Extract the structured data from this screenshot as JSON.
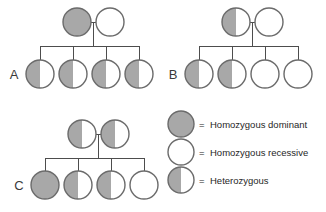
{
  "figure": {
    "type": "pedigree-genotype-chart",
    "colors": {
      "dominant_fill": "#a8a8a8",
      "recessive_fill": "#ffffff",
      "outline": "#6b6b6b",
      "line": "#4d4d4d",
      "text": "#262626",
      "label": "#3a3a3a",
      "background": "#ffffff"
    }
  },
  "panels": [
    {
      "id": "A",
      "label": "A",
      "label_x": 14,
      "label_y": 79,
      "parents": [
        {
          "name": "parent-1",
          "genotype": "homozygous-dominant",
          "cx": 77,
          "cy": 22,
          "r": 14
        },
        {
          "name": "parent-2",
          "genotype": "homozygous-recessive",
          "cx": 110,
          "cy": 22,
          "r": 14
        }
      ],
      "marriage_line": {
        "x1": 91,
        "y1": 22,
        "x2": 96,
        "y2": 22
      },
      "descent_line": {
        "x": 93.5,
        "y1": 22,
        "y2": 46
      },
      "sibship_line": {
        "x1": 40,
        "y1": 46,
        "x2": 140,
        "y2": 46
      },
      "children": [
        {
          "name": "child-1",
          "genotype": "heterozygous",
          "cx": 40,
          "cy": 74,
          "r": 14
        },
        {
          "name": "child-2",
          "genotype": "heterozygous",
          "cx": 73,
          "cy": 74,
          "r": 14
        },
        {
          "name": "child-3",
          "genotype": "heterozygous",
          "cx": 106,
          "cy": 74,
          "r": 14
        },
        {
          "name": "child-4",
          "genotype": "heterozygous",
          "cx": 139,
          "cy": 74,
          "r": 14
        }
      ]
    },
    {
      "id": "B",
      "label": "B",
      "label_x": 173,
      "label_y": 79,
      "parents": [
        {
          "name": "parent-1",
          "genotype": "heterozygous",
          "cx": 236,
          "cy": 22,
          "r": 14
        },
        {
          "name": "parent-2",
          "genotype": "homozygous-recessive",
          "cx": 269,
          "cy": 22,
          "r": 14
        }
      ],
      "marriage_line": {
        "x1": 250,
        "y1": 22,
        "x2": 255,
        "y2": 22
      },
      "descent_line": {
        "x": 252.5,
        "y1": 22,
        "y2": 46
      },
      "sibship_line": {
        "x1": 199,
        "y1": 46,
        "x2": 299,
        "y2": 46
      },
      "children": [
        {
          "name": "child-1",
          "genotype": "heterozygous",
          "cx": 199,
          "cy": 74,
          "r": 14
        },
        {
          "name": "child-2",
          "genotype": "heterozygous",
          "cx": 232,
          "cy": 74,
          "r": 14
        },
        {
          "name": "child-3",
          "genotype": "homozygous-recessive",
          "cx": 265,
          "cy": 74,
          "r": 14
        },
        {
          "name": "child-4",
          "genotype": "homozygous-recessive",
          "cx": 298,
          "cy": 74,
          "r": 14
        }
      ]
    },
    {
      "id": "C",
      "label": "C",
      "label_x": 19,
      "label_y": 190,
      "parents": [
        {
          "name": "parent-1",
          "genotype": "heterozygous",
          "cx": 82,
          "cy": 134,
          "r": 14
        },
        {
          "name": "parent-2",
          "genotype": "heterozygous",
          "cx": 115,
          "cy": 134,
          "r": 14
        }
      ],
      "marriage_line": {
        "x1": 96,
        "y1": 134,
        "x2": 101,
        "y2": 134
      },
      "descent_line": {
        "x": 98.5,
        "y1": 134,
        "y2": 158
      },
      "sibship_line": {
        "x1": 45,
        "y1": 158,
        "x2": 145,
        "y2": 158
      },
      "children": [
        {
          "name": "child-1",
          "genotype": "homozygous-dominant",
          "cx": 45,
          "cy": 185,
          "r": 14
        },
        {
          "name": "child-2",
          "genotype": "heterozygous",
          "cx": 78,
          "cy": 185,
          "r": 14
        },
        {
          "name": "child-3",
          "genotype": "heterozygous",
          "cx": 111,
          "cy": 185,
          "r": 14
        },
        {
          "name": "child-4",
          "genotype": "homozygous-recessive",
          "cx": 144,
          "cy": 185,
          "r": 14
        }
      ]
    }
  ],
  "legend": {
    "entries": [
      {
        "key": "homozygous-dominant",
        "equals": "=",
        "label": "Homozygous dominant",
        "cx": 181,
        "cy": 124,
        "r": 13,
        "text_x": 199,
        "text_y": 128,
        "equals_x": 199
      },
      {
        "key": "homozygous-recessive",
        "equals": "=",
        "label": "Homozygous recessive",
        "cx": 181,
        "cy": 152,
        "r": 13,
        "text_x": 199,
        "text_y": 156,
        "equals_x": 199
      },
      {
        "key": "heterozygous",
        "equals": "=",
        "label": "Heterozygous",
        "cx": 181,
        "cy": 180,
        "r": 13,
        "text_x": 199,
        "text_y": 184,
        "equals_x": 199
      }
    ]
  }
}
